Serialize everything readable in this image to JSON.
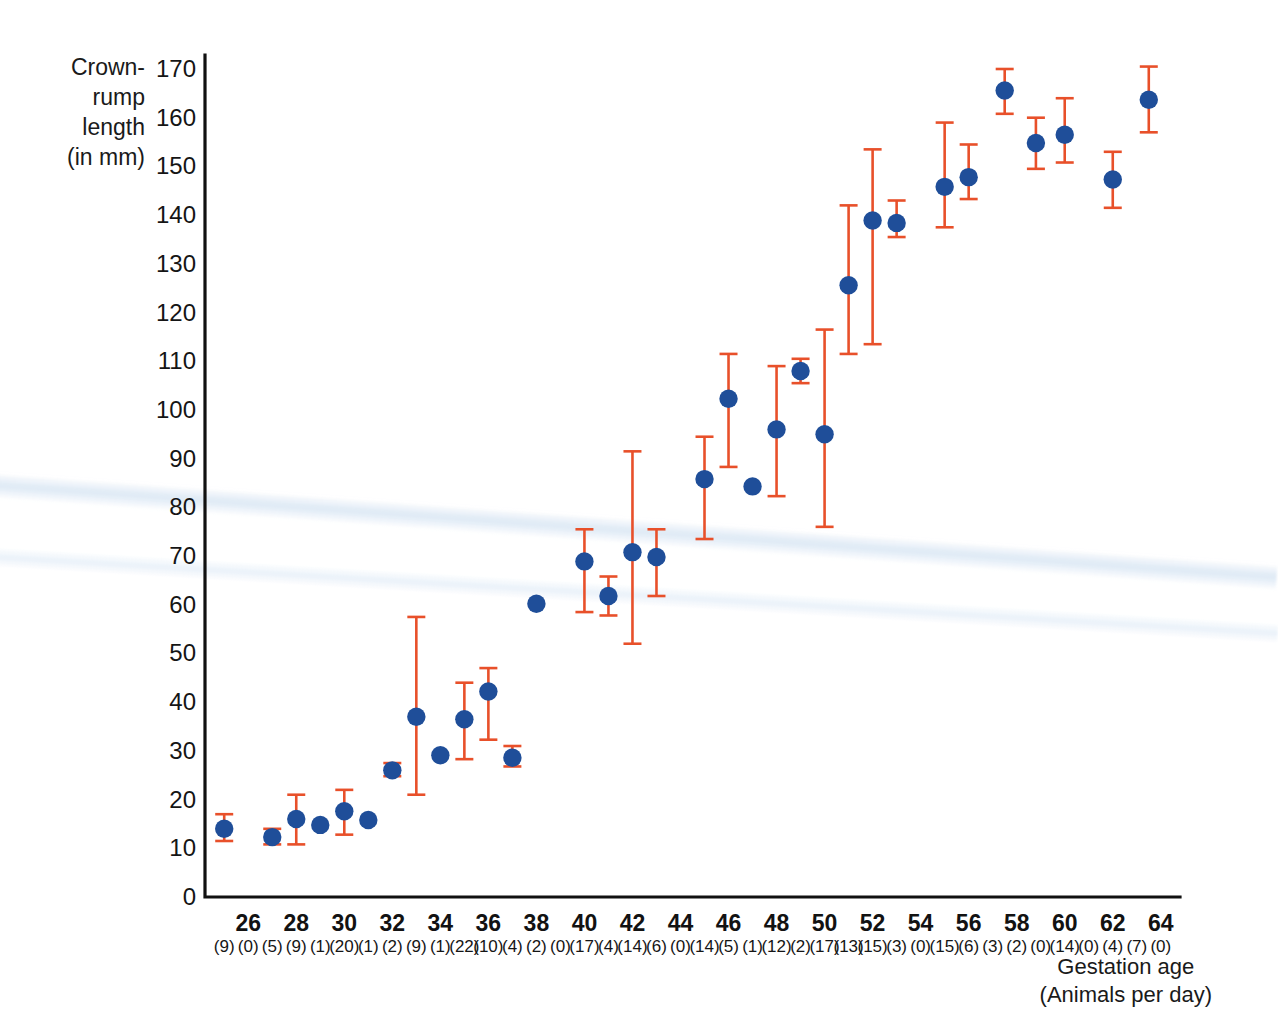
{
  "figure": {
    "y_axis_title": "Crown-\nrump\nlength\n(in mm)",
    "x_axis_title": "Gestation age\n(Animals per day)"
  },
  "chart_data": {
    "type": "scatter",
    "title": "",
    "xlabel": "Gestation age (Animals per day)",
    "ylabel": "Crown-rump length (in mm)",
    "xlim": [
      24.2,
      64.8
    ],
    "ylim": [
      0,
      170
    ],
    "grid": false,
    "legend": "none",
    "marker_color": "#1F4E99",
    "errorbar_color": "#E8502A",
    "axis_color": "#111111",
    "y_ticks": [
      0,
      10,
      20,
      30,
      40,
      50,
      60,
      70,
      80,
      90,
      100,
      110,
      120,
      130,
      140,
      150,
      160,
      170
    ],
    "x_ticks": [
      26,
      28,
      30,
      32,
      34,
      36,
      38,
      40,
      42,
      44,
      46,
      48,
      50,
      52,
      54,
      56,
      58,
      60,
      62,
      64
    ],
    "x_label_note": "Counts in parentheses give animals per day for every day from 25 to 64.",
    "animals_per_day": [
      {
        "day": 25,
        "count": 9
      },
      {
        "day": 26,
        "count": 0
      },
      {
        "day": 27,
        "count": 5
      },
      {
        "day": 28,
        "count": 9
      },
      {
        "day": 29,
        "count": 1
      },
      {
        "day": 30,
        "count": 20
      },
      {
        "day": 31,
        "count": 1
      },
      {
        "day": 32,
        "count": 2
      },
      {
        "day": 33,
        "count": 9
      },
      {
        "day": 34,
        "count": 1
      },
      {
        "day": 35,
        "count": 22
      },
      {
        "day": 36,
        "count": 10
      },
      {
        "day": 37,
        "count": 4
      },
      {
        "day": 38,
        "count": 2
      },
      {
        "day": 39,
        "count": 0
      },
      {
        "day": 40,
        "count": 17
      },
      {
        "day": 41,
        "count": 4
      },
      {
        "day": 42,
        "count": 14
      },
      {
        "day": 43,
        "count": 6
      },
      {
        "day": 44,
        "count": 0
      },
      {
        "day": 45,
        "count": 14
      },
      {
        "day": 46,
        "count": 5
      },
      {
        "day": 47,
        "count": 1
      },
      {
        "day": 48,
        "count": 12
      },
      {
        "day": 49,
        "count": 2
      },
      {
        "day": 50,
        "count": 17
      },
      {
        "day": 51,
        "count": 13
      },
      {
        "day": 52,
        "count": 15
      },
      {
        "day": 53,
        "count": 3
      },
      {
        "day": 54,
        "count": 0
      },
      {
        "day": 55,
        "count": 15
      },
      {
        "day": 56,
        "count": 6
      },
      {
        "day": 57,
        "count": 3
      },
      {
        "day": 58,
        "count": 2
      },
      {
        "day": 59,
        "count": 0
      },
      {
        "day": 60,
        "count": 14
      },
      {
        "day": 61,
        "count": 0
      },
      {
        "day": 62,
        "count": 4
      },
      {
        "day": 63,
        "count": 7
      },
      {
        "day": 64,
        "count": 0
      }
    ],
    "points": [
      {
        "x": 25.0,
        "y": 14.0,
        "low": 11.5,
        "high": 17.0
      },
      {
        "x": 27.0,
        "y": 12.3,
        "low": 10.8,
        "high": 14.0
      },
      {
        "x": 28.0,
        "y": 16.0,
        "low": 10.8,
        "high": 21.0
      },
      {
        "x": 29.0,
        "y": 14.8,
        "low": null,
        "high": null
      },
      {
        "x": 30.0,
        "y": 17.6,
        "low": 12.8,
        "high": 22.0
      },
      {
        "x": 31.0,
        "y": 15.8,
        "low": null,
        "high": null
      },
      {
        "x": 32.0,
        "y": 26.0,
        "low": 24.8,
        "high": 27.5
      },
      {
        "x": 33.0,
        "y": 37.0,
        "low": 21.0,
        "high": 57.5
      },
      {
        "x": 34.0,
        "y": 29.1,
        "low": null,
        "high": null
      },
      {
        "x": 35.0,
        "y": 36.5,
        "low": 28.3,
        "high": 44.0
      },
      {
        "x": 36.0,
        "y": 42.2,
        "low": 32.3,
        "high": 47.0
      },
      {
        "x": 37.0,
        "y": 28.6,
        "low": 26.8,
        "high": 31.0
      },
      {
        "x": 38.0,
        "y": 60.2,
        "low": null,
        "high": null
      },
      {
        "x": 40.0,
        "y": 68.9,
        "low": 58.5,
        "high": 75.5
      },
      {
        "x": 41.0,
        "y": 61.8,
        "low": 57.8,
        "high": 65.8
      },
      {
        "x": 42.0,
        "y": 70.8,
        "low": 52.0,
        "high": 91.5
      },
      {
        "x": 43.0,
        "y": 69.8,
        "low": 61.8,
        "high": 75.5
      },
      {
        "x": 45.0,
        "y": 85.8,
        "low": 73.5,
        "high": 94.5
      },
      {
        "x": 46.0,
        "y": 102.3,
        "low": 88.3,
        "high": 111.5
      },
      {
        "x": 47.0,
        "y": 84.3,
        "low": null,
        "high": null
      },
      {
        "x": 48.0,
        "y": 96.0,
        "low": 82.3,
        "high": 109.0
      },
      {
        "x": 49.0,
        "y": 108.0,
        "low": 105.5,
        "high": 110.5
      },
      {
        "x": 50.0,
        "y": 95.0,
        "low": 76.0,
        "high": 116.5
      },
      {
        "x": 51.0,
        "y": 125.6,
        "low": 111.5,
        "high": 142.0
      },
      {
        "x": 52.0,
        "y": 138.9,
        "low": 113.5,
        "high": 153.5
      },
      {
        "x": 53.0,
        "y": 138.4,
        "low": 135.5,
        "high": 143.0
      },
      {
        "x": 55.0,
        "y": 145.8,
        "low": 137.5,
        "high": 159.0
      },
      {
        "x": 56.0,
        "y": 147.8,
        "low": 143.3,
        "high": 154.5
      },
      {
        "x": 57.5,
        "y": 165.6,
        "low": 160.8,
        "high": 170.0
      },
      {
        "x": 58.8,
        "y": 154.8,
        "low": 149.5,
        "high": 160.0
      },
      {
        "x": 60.0,
        "y": 156.5,
        "low": 150.8,
        "high": 164.0
      },
      {
        "x": 62.0,
        "y": 147.3,
        "low": 141.5,
        "high": 153.0
      },
      {
        "x": 63.5,
        "y": 163.7,
        "low": 157.0,
        "high": 170.5
      }
    ]
  }
}
